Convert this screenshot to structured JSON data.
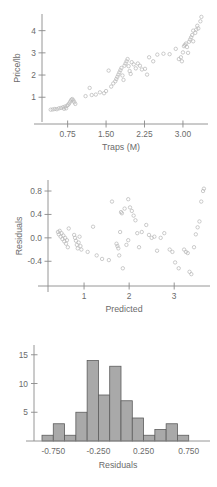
{
  "figure": {
    "title": "",
    "panel_count": 3
  },
  "chart_data": [
    {
      "id": "scatter-price-traps",
      "type": "scatter",
      "title": "",
      "xlabel": "Traps (M)",
      "ylabel": "Price/lb",
      "xticks": [
        "0.75",
        "1.50",
        "2.25",
        "3.00"
      ],
      "xtick_values": [
        0.75,
        1.5,
        2.25,
        3.0
      ],
      "yticks": [
        "1",
        "2",
        "3",
        "4"
      ],
      "ytick_values": [
        1,
        2,
        3,
        4
      ],
      "xlim": [
        0.25,
        3.45
      ],
      "ylim": [
        0.2,
        4.75
      ],
      "grid": false,
      "legend": "none",
      "marker": "open-circle",
      "points": [
        [
          0.42,
          0.44
        ],
        [
          0.46,
          0.45
        ],
        [
          0.5,
          0.47
        ],
        [
          0.54,
          0.46
        ],
        [
          0.58,
          0.5
        ],
        [
          0.62,
          0.52
        ],
        [
          0.66,
          0.55
        ],
        [
          0.7,
          0.58
        ],
        [
          0.72,
          0.5
        ],
        [
          0.74,
          0.62
        ],
        [
          0.76,
          0.66
        ],
        [
          0.78,
          0.72
        ],
        [
          0.8,
          0.8
        ],
        [
          0.82,
          0.88
        ],
        [
          0.84,
          0.92
        ],
        [
          0.86,
          0.86
        ],
        [
          0.88,
          0.78
        ],
        [
          0.9,
          0.7
        ],
        [
          1.1,
          1.05
        ],
        [
          1.18,
          1.42
        ],
        [
          1.22,
          1.1
        ],
        [
          1.3,
          1.12
        ],
        [
          1.38,
          1.22
        ],
        [
          1.46,
          1.18
        ],
        [
          1.55,
          2.2
        ],
        [
          1.6,
          1.48
        ],
        [
          1.64,
          1.62
        ],
        [
          1.68,
          1.72
        ],
        [
          1.7,
          1.82
        ],
        [
          1.72,
          1.92
        ],
        [
          1.74,
          2.02
        ],
        [
          1.76,
          2.12
        ],
        [
          1.78,
          2.22
        ],
        [
          1.8,
          2.32
        ],
        [
          1.82,
          1.98
        ],
        [
          1.84,
          1.78
        ],
        [
          1.86,
          2.42
        ],
        [
          1.88,
          2.52
        ],
        [
          1.9,
          2.62
        ],
        [
          1.92,
          2.72
        ],
        [
          1.94,
          2.4
        ],
        [
          1.96,
          2.18
        ],
        [
          1.98,
          2.05
        ],
        [
          2.0,
          2.58
        ],
        [
          2.04,
          2.48
        ],
        [
          2.08,
          2.3
        ],
        [
          2.12,
          2.52
        ],
        [
          2.16,
          2.42
        ],
        [
          2.2,
          2.25
        ],
        [
          2.26,
          2.28
        ],
        [
          2.34,
          2.8
        ],
        [
          2.42,
          2.62
        ],
        [
          2.5,
          2.92
        ],
        [
          2.62,
          2.96
        ],
        [
          2.74,
          2.94
        ],
        [
          2.86,
          3.18
        ],
        [
          2.92,
          2.72
        ],
        [
          2.96,
          2.8
        ],
        [
          3.0,
          3.02
        ],
        [
          3.02,
          3.3
        ],
        [
          3.04,
          3.36
        ],
        [
          3.06,
          3.42
        ],
        [
          3.08,
          3.26
        ],
        [
          3.1,
          3.0
        ],
        [
          3.12,
          3.5
        ],
        [
          3.14,
          3.6
        ],
        [
          3.16,
          3.7
        ],
        [
          3.18,
          3.8
        ],
        [
          3.2,
          3.52
        ],
        [
          3.24,
          3.9
        ],
        [
          3.26,
          4.05
        ],
        [
          3.28,
          4.22
        ],
        [
          3.3,
          4.1
        ],
        [
          3.34,
          4.42
        ],
        [
          3.36,
          4.62
        ],
        [
          3.2,
          4.0
        ],
        [
          2.98,
          2.62
        ],
        [
          2.3,
          2.02
        ],
        [
          1.5,
          1.28
        ],
        [
          0.68,
          0.48
        ]
      ]
    },
    {
      "id": "scatter-residuals-predicted",
      "type": "scatter",
      "title": "",
      "xlabel": "Predicted",
      "ylabel": "Residuals",
      "xticks": [
        "1",
        "2",
        "3"
      ],
      "xtick_values": [
        1,
        2,
        3
      ],
      "yticks": [
        "-0.4",
        "0.0",
        "0.4",
        "0.8"
      ],
      "ytick_values": [
        -0.4,
        0.0,
        0.4,
        0.8
      ],
      "xlim": [
        0.2,
        3.75
      ],
      "ylim": [
        -0.72,
        0.92
      ],
      "grid": false,
      "legend": "none",
      "marker": "open-circle",
      "points": [
        [
          0.42,
          0.1
        ],
        [
          0.44,
          0.06
        ],
        [
          0.46,
          0.12
        ],
        [
          0.48,
          0.02
        ],
        [
          0.5,
          0.08
        ],
        [
          0.52,
          -0.02
        ],
        [
          0.54,
          0.04
        ],
        [
          0.56,
          -0.06
        ],
        [
          0.58,
          0.0
        ],
        [
          0.6,
          -0.1
        ],
        [
          0.62,
          -0.04
        ],
        [
          0.66,
          0.16
        ],
        [
          0.78,
          0.05
        ],
        [
          0.8,
          0.0
        ],
        [
          0.82,
          -0.05
        ],
        [
          0.84,
          -0.12
        ],
        [
          0.86,
          -0.18
        ],
        [
          0.88,
          -0.08
        ],
        [
          0.9,
          0.02
        ],
        [
          0.92,
          -0.14
        ],
        [
          0.94,
          -0.2
        ],
        [
          1.08,
          -0.24
        ],
        [
          1.2,
          0.19
        ],
        [
          1.28,
          -0.3
        ],
        [
          1.4,
          -0.36
        ],
        [
          1.55,
          -0.38
        ],
        [
          1.62,
          0.62
        ],
        [
          1.72,
          -0.1
        ],
        [
          1.74,
          -0.14
        ],
        [
          1.76,
          -0.18
        ],
        [
          1.78,
          -0.3
        ],
        [
          1.8,
          0.1
        ],
        [
          1.82,
          0.44
        ],
        [
          1.84,
          0.42
        ],
        [
          1.86,
          -0.52
        ],
        [
          1.9,
          0.5
        ],
        [
          1.94,
          -0.12
        ],
        [
          1.98,
          0.66
        ],
        [
          2.02,
          0.52
        ],
        [
          2.06,
          0.46
        ],
        [
          2.1,
          0.38
        ],
        [
          2.14,
          0.3
        ],
        [
          2.18,
          0.08
        ],
        [
          2.22,
          -0.16
        ],
        [
          2.28,
          0.1
        ],
        [
          2.38,
          0.22
        ],
        [
          2.44,
          0.05
        ],
        [
          2.5,
          0.0
        ],
        [
          2.56,
          0.02
        ],
        [
          2.62,
          -0.22
        ],
        [
          2.78,
          0.08
        ],
        [
          2.9,
          -0.2
        ],
        [
          2.96,
          -0.24
        ],
        [
          3.02,
          -0.42
        ],
        [
          3.1,
          -0.52
        ],
        [
          3.22,
          -0.2
        ],
        [
          3.26,
          -0.24
        ],
        [
          3.3,
          -0.26
        ],
        [
          3.34,
          -0.58
        ],
        [
          3.38,
          -0.62
        ],
        [
          3.44,
          -0.16
        ],
        [
          3.48,
          0.06
        ],
        [
          3.52,
          0.18
        ],
        [
          3.56,
          0.28
        ],
        [
          3.6,
          0.62
        ],
        [
          3.64,
          0.8
        ],
        [
          3.66,
          0.84
        ],
        [
          2.7,
          0.0
        ],
        [
          1.98,
          -0.04
        ],
        [
          0.64,
          -0.16
        ]
      ]
    },
    {
      "id": "histogram-residuals",
      "type": "bar",
      "title": "",
      "xlabel": "Residuals",
      "ylabel": "",
      "xticks": [
        "-0.750",
        "-0.250",
        "0.250",
        "0.750"
      ],
      "xtick_values": [
        -0.75,
        -0.25,
        0.25,
        0.75
      ],
      "yticks": [
        "5",
        "10",
        "15"
      ],
      "ytick_values": [
        5,
        10,
        15
      ],
      "ylim": [
        0,
        16
      ],
      "xlim": [
        -0.875,
        0.875
      ],
      "bin_width": 0.125,
      "bin_starts": [
        -0.875,
        -0.75,
        -0.625,
        -0.5,
        -0.375,
        -0.25,
        -0.125,
        0.0,
        0.125,
        0.25,
        0.375,
        0.5,
        0.625,
        0.75
      ],
      "categories": [
        "-0.875",
        "-0.750",
        "-0.625",
        "-0.500",
        "-0.375",
        "-0.250",
        "-0.125",
        "0.000",
        "0.125",
        "0.250",
        "0.375",
        "0.500",
        "0.625",
        "0.750"
      ],
      "values": [
        1,
        3,
        1,
        5,
        14,
        8,
        13,
        7,
        4,
        1,
        2,
        3,
        1,
        0
      ],
      "grid": false,
      "legend": "none",
      "bar_fill": "#a9a9a9",
      "bar_stroke": "#5d5d5d"
    }
  ]
}
